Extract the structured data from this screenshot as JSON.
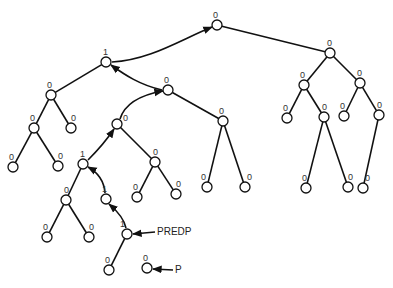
{
  "diagram": {
    "type": "binary-tree",
    "nodes": [
      {
        "id": "root",
        "x": 217,
        "y": 25,
        "label": "0",
        "lx": -4,
        "ly": -14
      },
      {
        "id": "a",
        "x": 106,
        "y": 62,
        "label": "1",
        "lx": -3,
        "ly": -14
      },
      {
        "id": "a1",
        "x": 51,
        "y": 95,
        "label": "0",
        "lx": -4,
        "ly": -14
      },
      {
        "id": "a1a",
        "x": 34,
        "y": 128,
        "label": "0",
        "lx": -4,
        "ly": -14
      },
      {
        "id": "a1b",
        "x": 71,
        "y": 128,
        "label": "0",
        "lx": 0,
        "ly": -14
      },
      {
        "id": "a1aa",
        "x": 13,
        "y": 167,
        "label": "0",
        "lx": -4,
        "ly": -14
      },
      {
        "id": "a1ab",
        "x": 58,
        "y": 166,
        "label": "0",
        "lx": 0,
        "ly": -14
      },
      {
        "id": "b",
        "x": 168,
        "y": 90,
        "label": "0",
        "lx": -4,
        "ly": -14
      },
      {
        "id": "c",
        "x": 223,
        "y": 121,
        "label": "0",
        "lx": -4,
        "ly": -14
      },
      {
        "id": "ca",
        "x": 207,
        "y": 187,
        "label": "0",
        "lx": -6,
        "ly": -14
      },
      {
        "id": "cb",
        "x": 245,
        "y": 187,
        "label": "0",
        "lx": 2,
        "ly": -14
      },
      {
        "id": "d",
        "x": 117,
        "y": 124,
        "label": "0",
        "lx": 6,
        "ly": -10
      },
      {
        "id": "e",
        "x": 155,
        "y": 162,
        "label": "0",
        "lx": -2,
        "ly": -14
      },
      {
        "id": "ea",
        "x": 137,
        "y": 197,
        "label": "0",
        "lx": -4,
        "ly": -14
      },
      {
        "id": "eb",
        "x": 176,
        "y": 194,
        "label": "0",
        "lx": 0,
        "ly": -14
      },
      {
        "id": "f",
        "x": 83,
        "y": 164,
        "label": "1",
        "lx": -3,
        "ly": -14
      },
      {
        "id": "g",
        "x": 66,
        "y": 200,
        "label": "0",
        "lx": -2,
        "ly": -14
      },
      {
        "id": "ga",
        "x": 47,
        "y": 237,
        "label": "0",
        "lx": -4,
        "ly": -14
      },
      {
        "id": "gb",
        "x": 89,
        "y": 237,
        "label": "0",
        "lx": 0,
        "ly": -14
      },
      {
        "id": "h",
        "x": 106,
        "y": 199,
        "label": "1",
        "lx": -4,
        "ly": -14
      },
      {
        "id": "i",
        "x": 127,
        "y": 234,
        "label": "1",
        "lx": -7,
        "ly": -14
      },
      {
        "id": "ia",
        "x": 109,
        "y": 270,
        "label": "0",
        "lx": -4,
        "ly": -14
      },
      {
        "id": "p",
        "x": 147,
        "y": 268,
        "label": "0",
        "lx": -4,
        "ly": -14
      },
      {
        "id": "r",
        "x": 330,
        "y": 53,
        "label": "0",
        "lx": -3,
        "ly": -14
      },
      {
        "id": "r1",
        "x": 304,
        "y": 85,
        "label": "0",
        "lx": -4,
        "ly": -14
      },
      {
        "id": "r2",
        "x": 360,
        "y": 83,
        "label": "0",
        "lx": -3,
        "ly": -14
      },
      {
        "id": "r1a",
        "x": 287,
        "y": 118,
        "label": "0",
        "lx": -4,
        "ly": -14
      },
      {
        "id": "r1b",
        "x": 324,
        "y": 117,
        "label": "0",
        "lx": -2,
        "ly": -14
      },
      {
        "id": "r2a",
        "x": 344,
        "y": 116,
        "label": "0",
        "lx": -4,
        "ly": -14
      },
      {
        "id": "r2b",
        "x": 379,
        "y": 115,
        "label": "0",
        "lx": -2,
        "ly": -14
      },
      {
        "id": "r1ba",
        "x": 306,
        "y": 188,
        "label": "0",
        "lx": -4,
        "ly": -14
      },
      {
        "id": "r1bb",
        "x": 348,
        "y": 187,
        "label": "0",
        "lx": 0,
        "ly": -14
      },
      {
        "id": "r2ba",
        "x": 363,
        "y": 188,
        "label": "0",
        "lx": 2,
        "ly": -14
      }
    ],
    "edges": [
      [
        "root",
        "r"
      ],
      [
        "a",
        "a1"
      ],
      [
        "a1",
        "a1a"
      ],
      [
        "a1",
        "a1b"
      ],
      [
        "a1a",
        "a1aa"
      ],
      [
        "a1a",
        "a1ab"
      ],
      [
        "b",
        "c"
      ],
      [
        "c",
        "ca"
      ],
      [
        "c",
        "cb"
      ],
      [
        "d",
        "e"
      ],
      [
        "e",
        "ea"
      ],
      [
        "e",
        "eb"
      ],
      [
        "f",
        "g"
      ],
      [
        "g",
        "ga"
      ],
      [
        "g",
        "gb"
      ],
      [
        "i",
        "ia"
      ],
      [
        "r",
        "r1"
      ],
      [
        "r",
        "r2"
      ],
      [
        "r1",
        "r1a"
      ],
      [
        "r1",
        "r1b"
      ],
      [
        "r2",
        "r2a"
      ],
      [
        "r2",
        "r2b"
      ],
      [
        "r1b",
        "r1ba"
      ],
      [
        "r1b",
        "r1bb"
      ],
      [
        "r2b",
        "r2ba"
      ]
    ],
    "thread_arrows": [
      {
        "from": "a",
        "to": "root",
        "path": "M112,62 C150,60 180,40 212,27"
      },
      {
        "from": "b",
        "to": "a",
        "path": "M162,90 C140,85 125,75 111,65"
      },
      {
        "from": "d",
        "to": "b",
        "path": "M120,119 C125,103 140,95 163,91"
      },
      {
        "from": "f",
        "to": "d",
        "path": "M88,160 C100,148 108,138 114,129"
      },
      {
        "from": "h",
        "to": "f",
        "path": "M105,193 C104,180 97,172 88,167"
      },
      {
        "from": "i",
        "to": "h",
        "path": "M126,228 C124,218 116,210 109,204"
      }
    ],
    "pointers": [
      {
        "label": "PREDP",
        "x": 157,
        "y": 227,
        "arrow": "M155,232 L133,234"
      },
      {
        "label": "P",
        "x": 175,
        "y": 265,
        "arrow": "M173,270 L153,269"
      }
    ],
    "node_radius": 5,
    "stroke_color": "#111111"
  }
}
